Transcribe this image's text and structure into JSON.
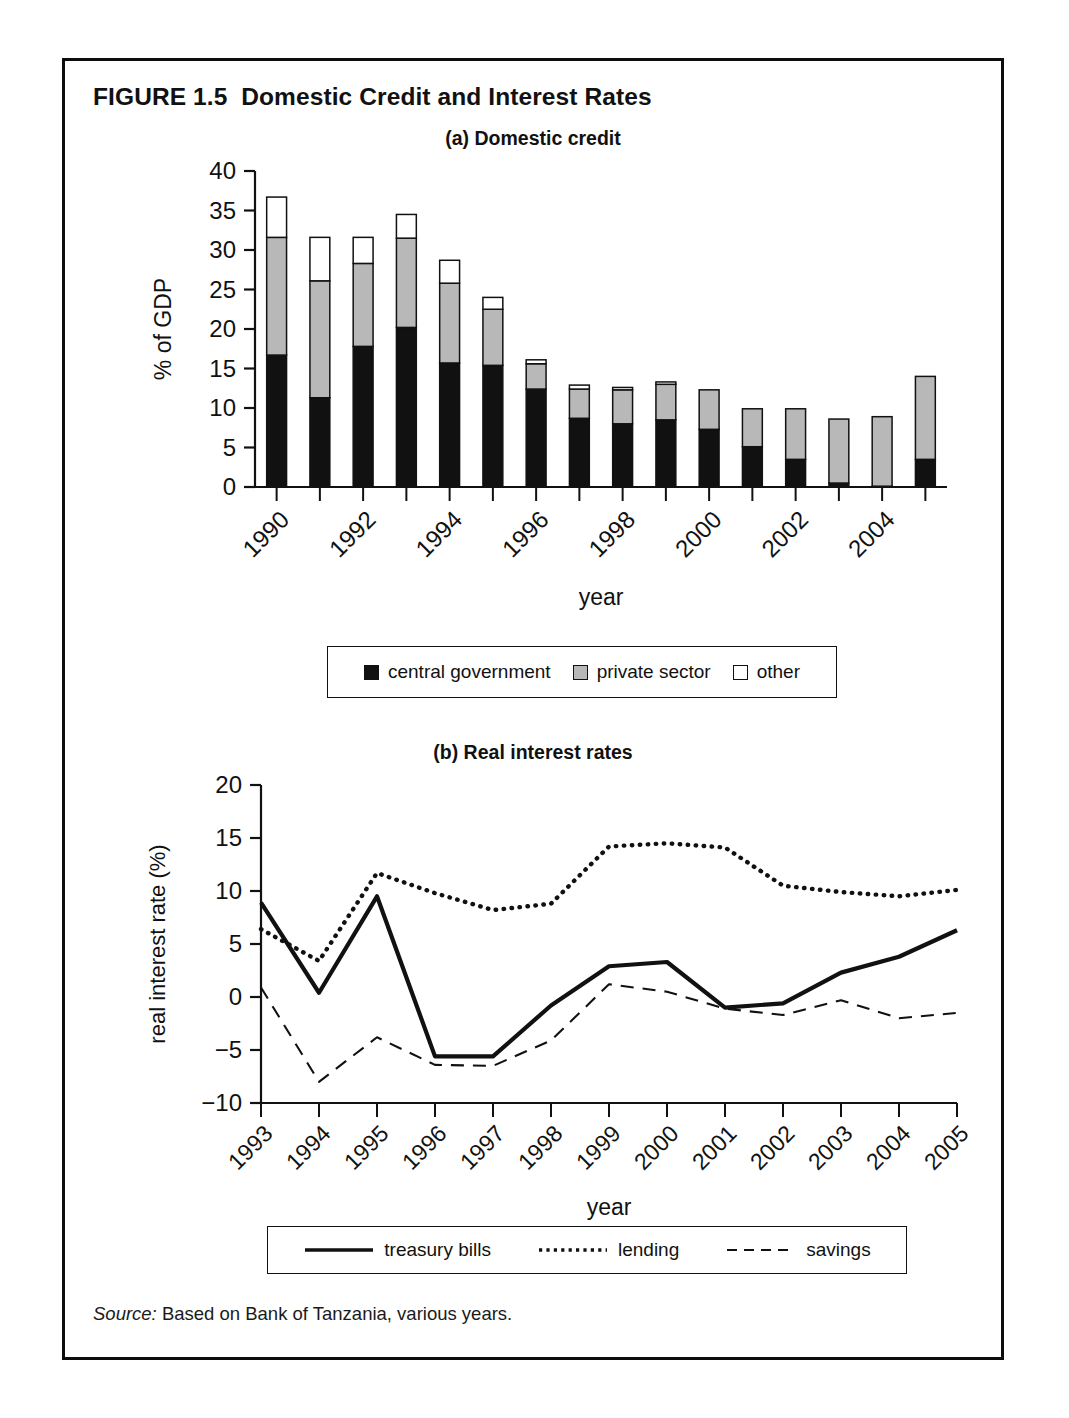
{
  "figure": {
    "title": "FIGURE 1.5  Domestic Credit and Interest Rates",
    "source_label": "Source:",
    "source_text": " Based on Bank of Tanzania, various years."
  },
  "panel_a": {
    "title": "(a) Domestic credit",
    "legend": [
      {
        "label": "central government",
        "swatch": "black-square-icon"
      },
      {
        "label": "private sector",
        "swatch": "gray-square-icon"
      },
      {
        "label": "other",
        "swatch": "white-square-icon"
      }
    ]
  },
  "panel_b": {
    "title": "(b) Real interest rates",
    "legend": [
      {
        "label": "treasury bills",
        "swatch": "solid-line-icon"
      },
      {
        "label": "lending",
        "swatch": "dotted-line-icon"
      },
      {
        "label": "savings",
        "swatch": "dashed-line-icon"
      }
    ]
  },
  "colors": {
    "central_government": "#111111",
    "private_sector": "#b8b8b8",
    "other": "#ffffff",
    "axis": "#111111"
  },
  "chart_data": [
    {
      "type": "bar",
      "id": "domestic-credit",
      "title": "(a) Domestic credit",
      "stacked": true,
      "xlabel": "year",
      "ylabel": "% of GDP",
      "ylim": [
        0,
        40
      ],
      "yticks": [
        0,
        5,
        10,
        15,
        20,
        25,
        30,
        35,
        40
      ],
      "grid": false,
      "legend_position": "below",
      "categories": [
        "1990",
        "1991",
        "1992",
        "1993",
        "1994",
        "1995",
        "1996",
        "1997",
        "1998",
        "1999",
        "2000",
        "2001",
        "2002",
        "2003",
        "2004",
        "2005"
      ],
      "xtick_labels": [
        "1990",
        "",
        "1992",
        "",
        "1994",
        "",
        "1996",
        "",
        "1998",
        "",
        "2000",
        "",
        "2002",
        "",
        "2004",
        ""
      ],
      "series": [
        {
          "name": "central government",
          "color": "#111111",
          "values": [
            16.7,
            11.3,
            17.8,
            20.2,
            15.7,
            15.4,
            12.4,
            8.7,
            8.0,
            8.5,
            7.3,
            5.1,
            3.5,
            0.5,
            0.1,
            3.5
          ]
        },
        {
          "name": "private sector",
          "color": "#b8b8b8",
          "values": [
            14.9,
            14.8,
            10.5,
            11.3,
            10.1,
            7.1,
            3.2,
            3.7,
            4.3,
            4.5,
            5.0,
            4.8,
            6.4,
            8.1,
            8.8,
            10.5
          ]
        },
        {
          "name": "other",
          "color": "#ffffff",
          "values": [
            5.1,
            5.5,
            3.3,
            3.0,
            2.9,
            1.5,
            0.5,
            0.5,
            0.3,
            0.3,
            0.0,
            0.0,
            0.0,
            0.0,
            0.0,
            0.0
          ]
        }
      ],
      "totals": [
        36.7,
        31.6,
        31.6,
        34.5,
        28.7,
        24.0,
        16.1,
        12.9,
        12.6,
        13.3,
        12.3,
        9.9,
        9.9,
        8.6,
        8.9,
        14.0
      ]
    },
    {
      "type": "line",
      "id": "real-interest-rates",
      "title": "(b) Real interest rates",
      "xlabel": "year",
      "ylabel": "real interest rate (%)",
      "ylim": [
        -10,
        20
      ],
      "yticks": [
        -10,
        -5,
        0,
        5,
        10,
        15,
        20
      ],
      "ytick_labels": [
        "−10",
        "−5",
        "0",
        "5",
        "10",
        "15",
        "20"
      ],
      "grid": false,
      "legend_position": "below",
      "x": [
        "1993",
        "1994",
        "1995",
        "1996",
        "1997",
        "1998",
        "1999",
        "2000",
        "2001",
        "2002",
        "2003",
        "2004",
        "2005"
      ],
      "series": [
        {
          "name": "treasury bills",
          "style": "solid",
          "color": "#111111",
          "values": [
            8.9,
            0.4,
            9.5,
            -5.6,
            -5.6,
            -0.8,
            2.9,
            3.3,
            -1.0,
            -0.6,
            2.3,
            3.8,
            6.3
          ]
        },
        {
          "name": "lending",
          "style": "dotted",
          "color": "#111111",
          "values": [
            6.4,
            3.4,
            11.7,
            9.8,
            8.2,
            8.8,
            14.2,
            14.5,
            14.1,
            10.5,
            9.9,
            9.5,
            10.1
          ]
        },
        {
          "name": "savings",
          "style": "dashed",
          "color": "#111111",
          "values": [
            0.9,
            -8.0,
            -3.8,
            -6.4,
            -6.5,
            -4.1,
            1.2,
            0.5,
            -1.1,
            -1.7,
            -0.3,
            -2.0,
            -1.5
          ]
        }
      ]
    }
  ]
}
